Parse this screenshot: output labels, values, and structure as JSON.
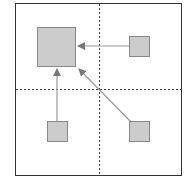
{
  "diagram": {
    "frame": {
      "x": 15,
      "y": 3,
      "w": 167,
      "h": 173,
      "stroke": "#333333"
    },
    "dividers": {
      "vertical_x": 99,
      "horizontal_y": 89,
      "stroke": "#444444"
    },
    "colors": {
      "box_fill": "#cccccc",
      "box_stroke": "#888888",
      "arrow": "#999999",
      "arrowhead": "#777777"
    },
    "nodes": [
      {
        "id": "target",
        "x": 37,
        "y": 27,
        "w": 38,
        "h": 39
      },
      {
        "id": "top-right",
        "x": 129,
        "y": 36,
        "w": 20,
        "h": 20
      },
      {
        "id": "bottom-left",
        "x": 47,
        "y": 121,
        "w": 20,
        "h": 20
      },
      {
        "id": "bottom-right",
        "x": 129,
        "y": 121,
        "w": 20,
        "h": 20
      }
    ],
    "arrows": [
      {
        "from": "top-right",
        "to": "target"
      },
      {
        "from": "bottom-left",
        "to": "target"
      },
      {
        "from": "bottom-right",
        "to": "target"
      }
    ]
  }
}
